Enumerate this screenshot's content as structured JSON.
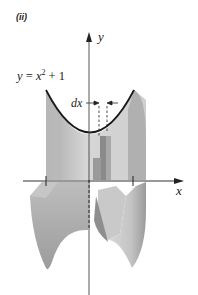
{
  "figure": {
    "part_label": "(ii)",
    "axis_y_label": "y",
    "axis_x_label": "x",
    "equation": {
      "lhs": "y",
      "eq": " = ",
      "base": "x",
      "exponent": "2",
      "rest": " + 1"
    },
    "dx_label": "dx",
    "colors": {
      "curve": "#1a1a1a",
      "axis": "#333333",
      "solid_light": "#d4d4d4",
      "solid_mid": "#b8b8b8",
      "solid_dark": "#8f8f8f",
      "background": "#ffffff"
    }
  }
}
